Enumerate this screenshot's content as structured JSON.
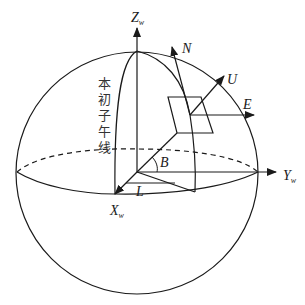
{
  "diagram": {
    "axes": {
      "z": {
        "label": "Z",
        "subscript": "w"
      },
      "y": {
        "label": "Y",
        "subscript": "w"
      },
      "x": {
        "label": "X",
        "subscript": "w"
      }
    },
    "local_frame": {
      "north": "N",
      "up": "U",
      "east": "E"
    },
    "angles": {
      "latitude": "B",
      "longitude": "L"
    },
    "prime_meridian_label": [
      "本",
      "初",
      "子",
      "午",
      "线"
    ],
    "colors": {
      "line": "#1a1a1a",
      "background": "#ffffff"
    }
  }
}
